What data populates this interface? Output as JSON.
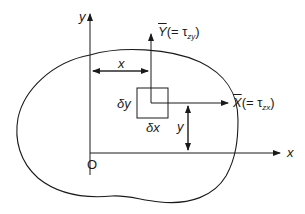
{
  "diagram": {
    "title": "",
    "colors": {
      "stroke": "#1a1a1a",
      "background": "#ffffff"
    },
    "axes": {
      "y_axis_label": "y",
      "x_axis_label": "x",
      "origin_label": "O"
    },
    "element": {
      "width_label": "δx",
      "height_label": "δy"
    },
    "dimensions": {
      "horizontal_distance_label": "x",
      "vertical_distance_label": "y"
    },
    "stress_components": {
      "Y": {
        "symbol": "Y",
        "equals": "(= τ",
        "subscript": "zy",
        "close": ")"
      },
      "X": {
        "symbol": "X",
        "equals": "(= τ",
        "subscript": "zx",
        "close": ")"
      }
    },
    "region": {
      "description": "arbitrary cross-section boundary"
    }
  }
}
